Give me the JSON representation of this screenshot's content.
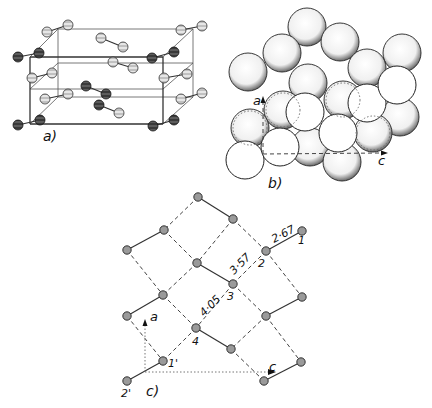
{
  "figure": {
    "panels": [
      {
        "id": "a",
        "label": "a)",
        "description": "Unit cell of molecular crystal with diatomic molecules"
      },
      {
        "id": "b",
        "label": "b)",
        "description": "Space-filling packing of molecules"
      },
      {
        "id": "c",
        "label": "c)",
        "description": "Projection of molecular layer with intermolecular distances"
      }
    ],
    "panel_b_axes": {
      "vertical": "a",
      "horizontal": "c"
    },
    "panel_c_axes": {
      "vertical": "a",
      "horizontal": "c"
    },
    "panel_c_atom_labels": [
      "1",
      "2",
      "3",
      "4",
      "1'",
      "2'"
    ],
    "panel_c_distances": [
      "2·67",
      "3·57",
      "4·05"
    ]
  },
  "colors": {
    "ink": "#222222",
    "atom_fill": "#999999",
    "dark_atom": "#333333",
    "light_atom": "#e8e8e8"
  }
}
